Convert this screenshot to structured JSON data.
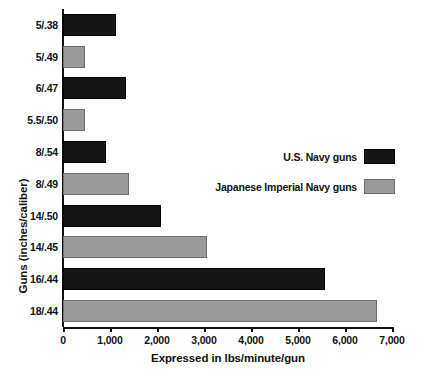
{
  "chart_data": {
    "type": "bar",
    "orientation": "horizontal",
    "title": "",
    "xlabel": "Expressed in lbs/minute/gun",
    "ylabel": "Guns (inches/caliber)",
    "categories": [
      "5/.38",
      "5/.49",
      "6/.47",
      "5.5/.50",
      "8/.54",
      "8/.49",
      "14/.50",
      "14/.45",
      "16/.44",
      "18/.44"
    ],
    "values": [
      1120,
      470,
      1340,
      470,
      910,
      1400,
      2090,
      3060,
      5570,
      6680
    ],
    "bar_series": [
      "U.S. Navy guns",
      "Japanese Imperial Navy guns",
      "U.S. Navy guns",
      "Japanese Imperial Navy guns",
      "U.S. Navy guns",
      "Japanese Imperial Navy guns",
      "U.S. Navy guns",
      "Japanese Imperial Navy guns",
      "U.S. Navy guns",
      "Japanese Imperial Navy guns"
    ],
    "xlim": [
      0,
      7000
    ],
    "xticks": [
      0,
      1000,
      2000,
      3000,
      4000,
      5000,
      6000,
      7000
    ],
    "xtick_labels": [
      "0",
      "1,000",
      "2,000",
      "3,000",
      "4,000",
      "5,000",
      "6,000",
      "7,000"
    ],
    "grid": false,
    "legend_position": "middle-right",
    "colors": {
      "us_navy": "#161616",
      "japanese_navy": "#9a9a9a",
      "axis": "#111111",
      "background": "#ffffff"
    }
  },
  "legend": {
    "entries": [
      {
        "label": "U.S. Navy guns",
        "key": "us"
      },
      {
        "label": "Japanese Imperial Navy guns",
        "key": "jp"
      }
    ]
  }
}
